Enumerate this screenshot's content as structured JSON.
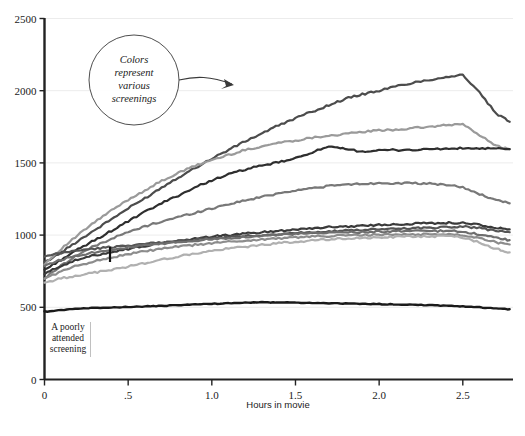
{
  "chart_data": {
    "type": "line",
    "title": "",
    "xlabel": "Hours in movie",
    "ylabel": "",
    "xlim": [
      0,
      2.8
    ],
    "ylim": [
      0,
      2500
    ],
    "grid": "horizontal",
    "legend": "none",
    "x_ticks": [
      {
        "value": 0,
        "label": "0"
      },
      {
        "value": 0.5,
        "label": ".5"
      },
      {
        "value": 1.0,
        "label": "1.0"
      },
      {
        "value": 1.5,
        "label": "1.5"
      },
      {
        "value": 2.0,
        "label": "2.0"
      },
      {
        "value": 2.5,
        "label": "2.5"
      }
    ],
    "y_ticks": [
      {
        "value": 0,
        "label": "0"
      },
      {
        "value": 500,
        "label": "500"
      },
      {
        "value": 1000,
        "label": "1000"
      },
      {
        "value": 1500,
        "label": "1500"
      },
      {
        "value": 2000,
        "label": "2000"
      },
      {
        "value": 2500,
        "label": "2500"
      }
    ],
    "x": [
      0,
      0.1,
      0.2,
      0.3,
      0.4,
      0.5,
      0.6,
      0.7,
      0.8,
      0.9,
      1.0,
      1.1,
      1.2,
      1.3,
      1.4,
      1.5,
      1.6,
      1.7,
      1.8,
      1.9,
      2.0,
      2.1,
      2.2,
      2.3,
      2.4,
      2.5,
      2.6,
      2.7,
      2.78
    ],
    "series": [
      {
        "name": "screening-1",
        "color": "#4c4c4c",
        "width": 2.2,
        "values": [
          810,
          880,
          960,
          1035,
          1110,
          1185,
          1255,
          1330,
          1400,
          1465,
          1530,
          1590,
          1650,
          1705,
          1760,
          1810,
          1855,
          1900,
          1945,
          1975,
          2000,
          2030,
          2055,
          2075,
          2095,
          2110,
          1985,
          1840,
          1785
        ]
      },
      {
        "name": "screening-2",
        "color": "#9a9a9a",
        "width": 2.2,
        "values": [
          800,
          905,
          1000,
          1090,
          1170,
          1245,
          1310,
          1375,
          1430,
          1480,
          1520,
          1555,
          1590,
          1615,
          1640,
          1655,
          1675,
          1690,
          1700,
          1715,
          1725,
          1730,
          1740,
          1750,
          1760,
          1770,
          1690,
          1620,
          1595
        ]
      },
      {
        "name": "screening-3",
        "color": "#2e2e2e",
        "width": 2.2,
        "values": [
          760,
          830,
          900,
          965,
          1030,
          1095,
          1160,
          1220,
          1275,
          1330,
          1380,
          1420,
          1455,
          1480,
          1505,
          1530,
          1575,
          1610,
          1595,
          1580,
          1585,
          1590,
          1590,
          1595,
          1598,
          1600,
          1600,
          1598,
          1595
        ]
      },
      {
        "name": "screening-4",
        "color": "#787878",
        "width": 2.2,
        "values": [
          700,
          790,
          865,
          925,
          975,
          1020,
          1060,
          1095,
          1125,
          1155,
          1185,
          1215,
          1240,
          1265,
          1290,
          1310,
          1325,
          1340,
          1350,
          1355,
          1360,
          1360,
          1358,
          1355,
          1350,
          1330,
          1285,
          1240,
          1220
        ]
      },
      {
        "name": "screening-5",
        "color": "#3a3a3a",
        "width": 2.2,
        "values": [
          730,
          790,
          830,
          860,
          885,
          905,
          925,
          945,
          960,
          975,
          990,
          1000,
          1010,
          1020,
          1030,
          1040,
          1048,
          1055,
          1060,
          1065,
          1070,
          1075,
          1080,
          1082,
          1085,
          1085,
          1070,
          1050,
          1040
        ]
      },
      {
        "name": "screening-6",
        "color": "#555555",
        "width": 2.2,
        "values": [
          850,
          875,
          895,
          905,
          918,
          928,
          938,
          948,
          958,
          968,
          978,
          986,
          994,
          1000,
          1008,
          1015,
          1020,
          1026,
          1030,
          1035,
          1040,
          1045,
          1048,
          1052,
          1056,
          1060,
          1048,
          1030,
          1020
        ]
      },
      {
        "name": "screening-7",
        "color": "#6e6e6e",
        "width": 2.2,
        "values": [
          790,
          830,
          860,
          882,
          900,
          915,
          928,
          940,
          952,
          962,
          972,
          980,
          988,
          995,
          1002,
          1008,
          1012,
          1016,
          1020,
          1022,
          1024,
          1026,
          1028,
          1028,
          1028,
          1025,
          1005,
          980,
          965
        ]
      },
      {
        "name": "screening-8",
        "color": "#8c8c8c",
        "width": 2.2,
        "values": [
          700,
          748,
          790,
          820,
          845,
          868,
          888,
          905,
          920,
          932,
          944,
          954,
          962,
          970,
          978,
          984,
          990,
          994,
          998,
          1000,
          1002,
          1004,
          1005,
          1006,
          1006,
          1002,
          980,
          950,
          935
        ]
      },
      {
        "name": "screening-9",
        "color": "#b0b0b0",
        "width": 2.2,
        "values": [
          670,
          700,
          722,
          740,
          760,
          782,
          806,
          830,
          852,
          872,
          890,
          906,
          920,
          932,
          944,
          954,
          962,
          970,
          976,
          980,
          984,
          988,
          990,
          992,
          992,
          985,
          950,
          905,
          880
        ]
      },
      {
        "name": "screening-10",
        "color": "#1a1a1a",
        "width": 2.4,
        "values": [
          470,
          480,
          492,
          496,
          500,
          502,
          506,
          510,
          515,
          520,
          524,
          528,
          532,
          534,
          534,
          532,
          530,
          528,
          526,
          524,
          522,
          520,
          518,
          514,
          510,
          506,
          500,
          492,
          486
        ]
      }
    ],
    "annotations": [
      {
        "name": "colors-callout",
        "lines": [
          "Colors",
          "represent",
          "various",
          "screenings"
        ],
        "shape": "circle",
        "arrow": true
      },
      {
        "name": "poorly-attended-note",
        "lines": [
          "A poorly",
          "attended",
          "screening"
        ]
      }
    ]
  },
  "caption": {
    "partial_text": " "
  }
}
